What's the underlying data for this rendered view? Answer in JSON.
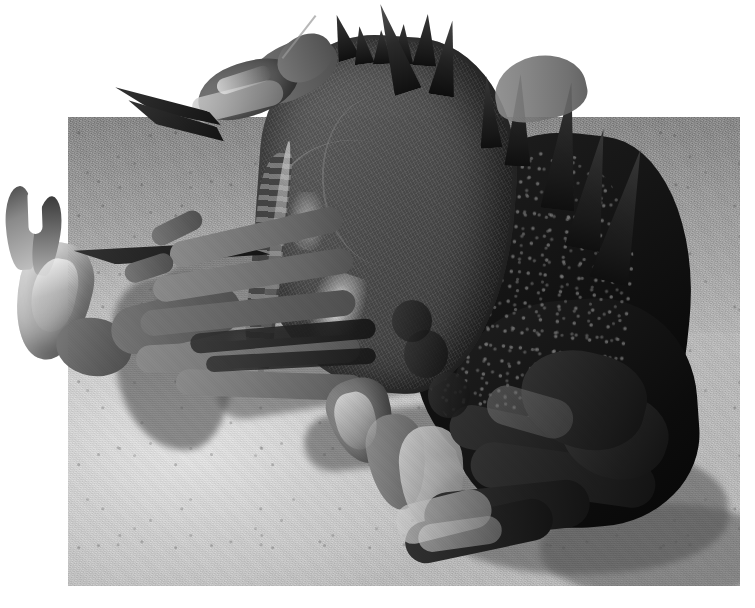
{
  "image": {
    "type": "photograph",
    "subject": "crab",
    "description": "Black and white photograph of a large spiny crab resting on sand, photographed from a low three-quarter angle. The crab's claws and legs extend past the rectangular photo border onto the white page background.",
    "palette": {
      "page_background": "#ffffff",
      "sand_light": "#d8d6cf",
      "sand_mid": "#bcbab3",
      "sand_dark": "#9d9b95",
      "shadow": "#55534e",
      "carapace_light": "#6f6d67",
      "carapace_mid": "#57554d",
      "carapace_dark": "#0d0c08",
      "claw_pale": "#d3d1c8"
    },
    "photo_frame": {
      "left": 68,
      "top": 117,
      "width": 672,
      "height": 469,
      "border": "none",
      "note": "Rectangular photo plate; subject bleeds outside it on all sides except the bottom."
    },
    "elements": [
      {
        "name": "sand-substrate",
        "label": "Sand substrate",
        "region": "full photo plate"
      },
      {
        "name": "cast-shadow",
        "label": "Cast shadow of crab on sand",
        "region": "left and lower-centre"
      },
      {
        "name": "carapace",
        "label": "Crab carapace (shell)",
        "region": "centre"
      },
      {
        "name": "lateral-spines",
        "label": "Row of lateral carapace spines",
        "count": 9
      },
      {
        "name": "left-claw",
        "label": "Left cheliped (claw), raised, outside frame",
        "region": "far left"
      },
      {
        "name": "upper-claw",
        "label": "Upper cheliped (claw), outside frame",
        "region": "upper left"
      },
      {
        "name": "walking-legs",
        "label": "Walking legs",
        "count": 4,
        "region": "left of body"
      },
      {
        "name": "right-limbs",
        "label": "Right side limbs in shadow",
        "region": "lower right"
      },
      {
        "name": "dark-flank",
        "label": "Speckled dark right flank of carapace",
        "region": "right"
      }
    ]
  }
}
